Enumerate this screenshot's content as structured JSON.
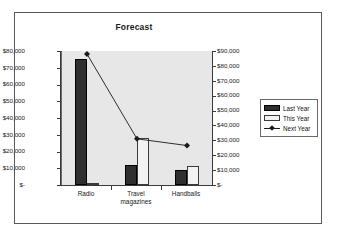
{
  "chart_data": {
    "type": "bar",
    "title": "Forecast",
    "xlabel": "",
    "ylabel": "",
    "categories": [
      "Radio",
      "Travel\nmagazines",
      "Handballs"
    ],
    "grid": false,
    "legend_position": "right",
    "primary_axis": {
      "ylim": [
        0,
        80000
      ],
      "ticks": [
        "$-",
        "$10,000",
        "$20,000",
        "$30,000",
        "$40,000",
        "$50,000",
        "$60,000",
        "$70,000",
        "$80,000"
      ],
      "tick_values": [
        0,
        10000,
        20000,
        30000,
        40000,
        50000,
        60000,
        70000,
        80000
      ]
    },
    "secondary_axis": {
      "ylim": [
        0,
        90000
      ],
      "ticks": [
        "$-",
        "$10,000",
        "$20,000",
        "$30,000",
        "$40,000",
        "$50,000",
        "$60,000",
        "$70,000",
        "$80,000",
        "$90,000"
      ],
      "tick_values": [
        0,
        10000,
        20000,
        30000,
        40000,
        50000,
        60000,
        70000,
        80000,
        90000
      ]
    },
    "series": [
      {
        "name": "Last Year",
        "type": "bar",
        "axis": "primary",
        "color": "#2f2f2f",
        "values": [
          75500,
          12000,
          9000
        ]
      },
      {
        "name": "This Year",
        "type": "bar",
        "axis": "primary",
        "color": "#f2f2f2",
        "values": [
          300,
          28000,
          11500
        ]
      },
      {
        "name": "Next Year",
        "type": "line",
        "axis": "secondary",
        "color": "#1a1a1a",
        "values": [
          88000,
          31000,
          26500
        ]
      }
    ]
  },
  "legend": {
    "items": [
      {
        "label": "Last Year"
      },
      {
        "label": "This Year"
      },
      {
        "label": "Next Year"
      }
    ]
  }
}
